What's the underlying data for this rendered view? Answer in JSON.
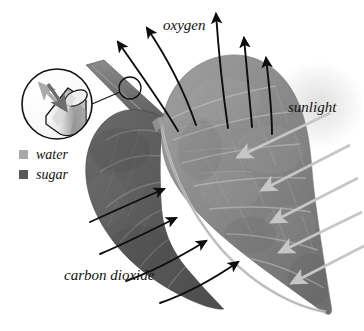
{
  "figure": {
    "background_color": "#ffffff"
  },
  "labels": {
    "oxygen": "oxygen",
    "sunlight": "sunlight",
    "carbon_dioxide": "carbon dioxide"
  },
  "legend": {
    "items": [
      {
        "label": "water",
        "color": "#a8a8a8"
      },
      {
        "label": "sugar",
        "color": "#595959"
      }
    ]
  },
  "colors": {
    "leaf_light": "#8f8f8f",
    "leaf_mid": "#7a7a7a",
    "leaf_dark": "#5e5e5e",
    "leaf_darkest": "#4a4a4a",
    "vein": "#b9b9b9",
    "arrow_black": "#0d0d0d",
    "arrow_sunlight": "#c9c9c9",
    "water_arrow": "#b0b0b0",
    "sugar_arrow": "#6a6a6a",
    "stem": "#707070",
    "inset_outline": "#111111",
    "glow": "#dadada"
  },
  "arrows": {
    "oxygen": {
      "count": 4,
      "direction": "upward",
      "color": "#0d0d0d",
      "description": "four curved black arrows rising from leaf surface"
    },
    "carbon_dioxide": {
      "count": 4,
      "direction": "up-right into leaf",
      "color": "#0d0d0d",
      "description": "four curved black arrows entering the leaf from lower left"
    },
    "sunlight": {
      "count": 5,
      "direction": "down-left onto leaf",
      "color": "#c9c9c9",
      "description": "five straight pale arrows striking the leaf from upper right"
    }
  },
  "inset": {
    "name": "stem-cross-section-magnifier",
    "description": "circular magnified view of the cut petiole showing water moving up and sugar moving down",
    "water_arrow_direction": "up-left",
    "sugar_arrow_direction": "down-right"
  },
  "callout": {
    "marker": "small circle on petiole",
    "leader": "line connecting petiole marker to magnifier circle"
  }
}
